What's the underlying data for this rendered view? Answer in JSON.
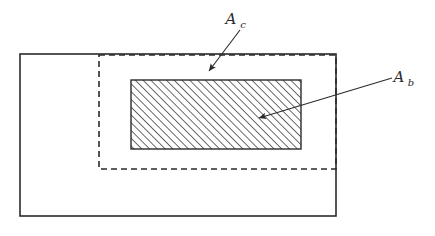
{
  "figure": {
    "type": "geometric-diagram",
    "background_color": "#ffffff",
    "line_color": "#2b2b2b",
    "hatch_color": "#3a3a3a",
    "canvas": {
      "width": 435,
      "height": 236
    }
  },
  "shapes": {
    "outer_rect": {
      "name": "outer-solid-rectangle",
      "style": "solid",
      "stroke_width": 1.6,
      "x": 20,
      "y": 54,
      "width": 316,
      "height": 162
    },
    "dashed_rect": {
      "name": "inner-dashed-rectangle",
      "style": "dashed",
      "stroke_width": 1.6,
      "dash_pattern": "6 4",
      "x": 99,
      "y": 55,
      "width": 237,
      "height": 114
    },
    "hatched_rect": {
      "name": "hatched-rectangle",
      "style": "solid-with-diagonal-hatch",
      "stroke_width": 1.4,
      "hatch_angle_deg": 45,
      "hatch_spacing": 5.5,
      "x": 131,
      "y": 80,
      "width": 170,
      "height": 69
    }
  },
  "annotations": [
    {
      "id": "ac",
      "label_base": "A",
      "label_subscript": "c",
      "label_text": "A_c",
      "label_x": 231,
      "label_y": 24,
      "sub_x": 243,
      "sub_y": 28,
      "leader_from": {
        "x": 240,
        "y": 30
      },
      "leader_to": {
        "x": 209,
        "y": 71
      },
      "arrowhead": "filled-triangle"
    },
    {
      "id": "ab",
      "label_base": "A",
      "label_subscript": "b",
      "label_text": "A_b",
      "label_x": 399,
      "label_y": 82,
      "sub_x": 411,
      "sub_y": 86,
      "leader_from": {
        "x": 392,
        "y": 78
      },
      "leader_to": {
        "x": 259,
        "y": 118
      },
      "arrowhead": "filled-triangle"
    }
  ]
}
